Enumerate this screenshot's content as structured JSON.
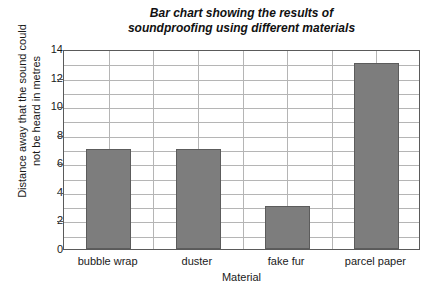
{
  "chart_data": {
    "type": "bar",
    "title": "Bar chart showing the results of\nsoundproofing using different materials",
    "categories": [
      "bubble wrap",
      "duster",
      "fake fur",
      "parcel paper"
    ],
    "values": [
      7,
      7,
      3,
      13
    ],
    "xlabel": "Material",
    "ylabel": "Distance away that the sound could\nnot be heard in metres",
    "ylim": [
      0,
      14
    ],
    "ytick_labels": [
      "0",
      "2",
      "4",
      "6",
      "8",
      "10",
      "12",
      "14"
    ],
    "ytick_values": [
      0,
      2,
      4,
      6,
      8,
      10,
      12,
      14
    ],
    "y_minor_step": 1,
    "grid": "horizontal-and-vertical",
    "legend": "none",
    "bar_color": "#7d7d7d",
    "bar_edge_color": "#5c5c5c",
    "grid_color": "#b5b5b5",
    "axis_color": "#5a5a5a",
    "background_color": "#ffffff"
  }
}
